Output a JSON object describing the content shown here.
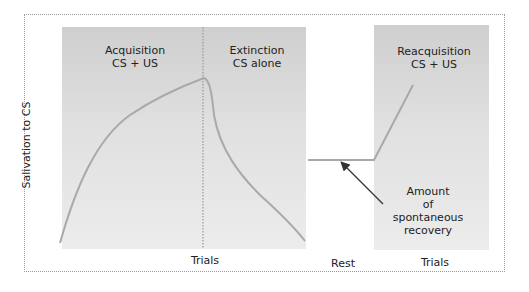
{
  "diagram": {
    "y_axis_label": "Salivation to CS",
    "phases": [
      {
        "name": "Acquisition",
        "condition": "CS + US"
      },
      {
        "name": "Extinction",
        "condition": "CS alone"
      },
      {
        "name": "Reacquisition",
        "condition": "CS + US"
      }
    ],
    "x_labels": {
      "left": "Trials",
      "middle": "Rest",
      "right": "Trials"
    },
    "annotation": {
      "lines": [
        "Amount",
        "of",
        "spontaneous",
        "recovery"
      ]
    },
    "colors": {
      "curve": "#a9a9a9",
      "panel": "#dcdcdc",
      "arrow": "#333333",
      "divider": "#8a8a8a"
    }
  }
}
